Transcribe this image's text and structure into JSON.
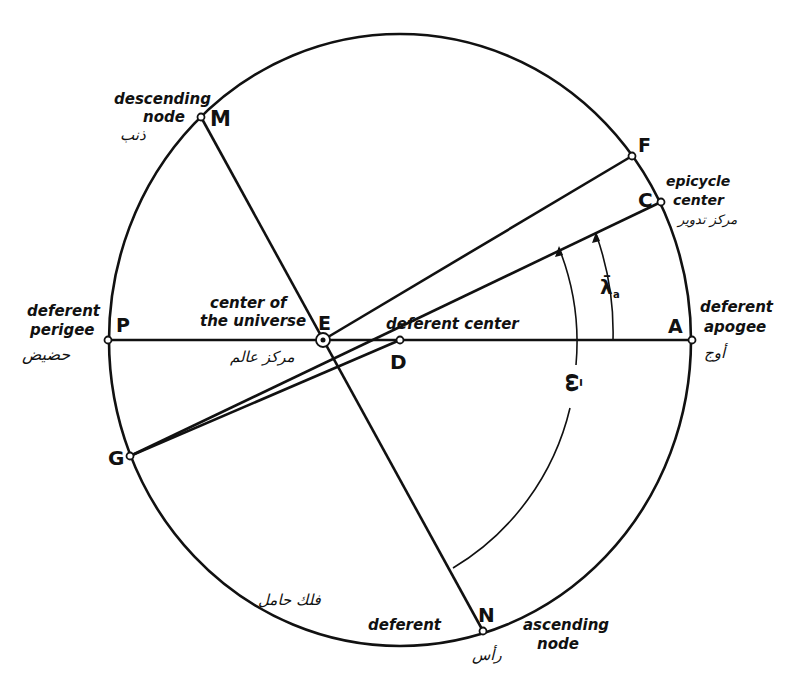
{
  "diagram": {
    "colors": {
      "ink": "#111111",
      "background": "#ffffff"
    },
    "deferent_label": "deferent",
    "deferent_arabic": "فلك حامل",
    "points": {
      "M": {
        "letter": "M",
        "label_line1": "descending",
        "label_line2": "node",
        "arabic": "ذنب"
      },
      "F": {
        "letter": "F"
      },
      "C": {
        "letter": "C",
        "label_line1": "epicycle",
        "label_line2": "center",
        "arabic": "مركز تدوير"
      },
      "P": {
        "letter": "P",
        "label_line1": "deferent",
        "label_line2": "perigee",
        "arabic": "حضيض"
      },
      "E": {
        "letter": "E",
        "label_line1": "center of",
        "label_line2": "the universe",
        "arabic": "مركز عالم"
      },
      "D": {
        "letter": "D",
        "label": "deferent center"
      },
      "A": {
        "letter": "A",
        "label_line1": "deferent",
        "label_line2": "apogee",
        "arabic": "أوج"
      },
      "G": {
        "letter": "G"
      },
      "N": {
        "letter": "N",
        "label_line1": "ascending",
        "label_line2": "node",
        "arabic": "رأس"
      }
    },
    "angles": {
      "lambda": {
        "symbol": "λ̄",
        "subscript": "a"
      },
      "omega": {
        "symbol": "ω̄"
      }
    }
  }
}
